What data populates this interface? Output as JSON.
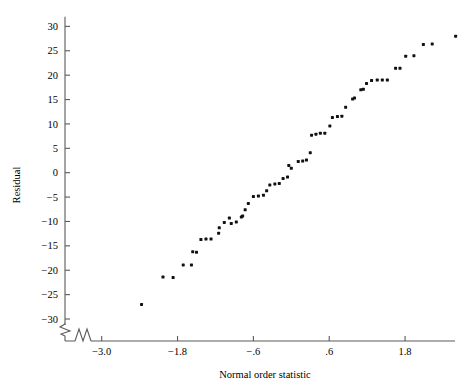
{
  "chart_data": {
    "type": "scatter",
    "title": "",
    "xlabel": "Normal order statistic",
    "ylabel": "Residual",
    "xlim": [
      -3.45,
      2.25
    ],
    "ylim": [
      -32.5,
      32.0
    ],
    "grid": false,
    "legend": null,
    "axis_break": {
      "x_axis": true,
      "y_axis": true
    },
    "xticks": [
      -3.0,
      -1.8,
      -0.6,
      0.6,
      1.8
    ],
    "xtick_labels": [
      "−3.0",
      "−1.8",
      "−.6",
      ".6",
      "1.8"
    ],
    "yticks": [
      30,
      25,
      20,
      15,
      10,
      5,
      0,
      -5,
      -10,
      -15,
      -20,
      -25,
      -30
    ],
    "ytick_labels": [
      "30",
      "25",
      "20",
      "15",
      "10",
      "5",
      "0",
      "−5",
      "−10",
      "−15",
      "−20",
      "−25",
      "−30"
    ],
    "marker": "filled-square",
    "marker_color": "#111111",
    "marker_size": 3.0,
    "n_points": 60,
    "points": [
      {
        "x": -2.37,
        "y": -27.0
      },
      {
        "x": -2.03,
        "y": -21.4
      },
      {
        "x": -1.87,
        "y": -21.5
      },
      {
        "x": -1.71,
        "y": -18.9
      },
      {
        "x": -1.58,
        "y": -18.9
      },
      {
        "x": -1.56,
        "y": -16.2
      },
      {
        "x": -1.5,
        "y": -16.3
      },
      {
        "x": -1.43,
        "y": -13.7
      },
      {
        "x": -1.35,
        "y": -13.6
      },
      {
        "x": -1.27,
        "y": -13.6
      },
      {
        "x": -1.15,
        "y": -12.4
      },
      {
        "x": -1.14,
        "y": -11.3
      },
      {
        "x": -1.06,
        "y": -10.2
      },
      {
        "x": -0.98,
        "y": -9.3
      },
      {
        "x": -0.95,
        "y": -10.4
      },
      {
        "x": -0.87,
        "y": -10.1
      },
      {
        "x": -0.79,
        "y": -9.1
      },
      {
        "x": -0.77,
        "y": -8.9
      },
      {
        "x": -0.73,
        "y": -7.6
      },
      {
        "x": -0.68,
        "y": -6.3
      },
      {
        "x": -0.6,
        "y": -4.9
      },
      {
        "x": -0.52,
        "y": -4.8
      },
      {
        "x": -0.44,
        "y": -4.6
      },
      {
        "x": -0.39,
        "y": -3.7
      },
      {
        "x": -0.34,
        "y": -2.5
      },
      {
        "x": -0.26,
        "y": -2.3
      },
      {
        "x": -0.19,
        "y": -2.2
      },
      {
        "x": -0.13,
        "y": -1.2
      },
      {
        "x": -0.06,
        "y": -0.9
      },
      {
        "x": -0.04,
        "y": 1.5
      },
      {
        "x": 0.0,
        "y": 0.9
      },
      {
        "x": 0.11,
        "y": 2.3
      },
      {
        "x": 0.18,
        "y": 2.4
      },
      {
        "x": 0.24,
        "y": 2.6
      },
      {
        "x": 0.3,
        "y": 4.1
      },
      {
        "x": 0.32,
        "y": 7.7
      },
      {
        "x": 0.39,
        "y": 7.9
      },
      {
        "x": 0.46,
        "y": 8.1
      },
      {
        "x": 0.53,
        "y": 8.1
      },
      {
        "x": 0.61,
        "y": 9.6
      },
      {
        "x": 0.65,
        "y": 11.3
      },
      {
        "x": 0.73,
        "y": 11.5
      },
      {
        "x": 0.8,
        "y": 11.6
      },
      {
        "x": 0.86,
        "y": 13.4
      },
      {
        "x": 0.97,
        "y": 15.1
      },
      {
        "x": 1.0,
        "y": 15.3
      },
      {
        "x": 1.1,
        "y": 17.0
      },
      {
        "x": 1.14,
        "y": 17.1
      },
      {
        "x": 1.19,
        "y": 18.3
      },
      {
        "x": 1.27,
        "y": 18.9
      },
      {
        "x": 1.36,
        "y": 19.0
      },
      {
        "x": 1.44,
        "y": 19.0
      },
      {
        "x": 1.52,
        "y": 19.0
      },
      {
        "x": 1.65,
        "y": 21.4
      },
      {
        "x": 1.72,
        "y": 21.4
      },
      {
        "x": 1.81,
        "y": 23.9
      },
      {
        "x": 1.94,
        "y": 24.0
      },
      {
        "x": 2.09,
        "y": 26.3
      },
      {
        "x": 2.23,
        "y": 26.4
      },
      {
        "x": 2.6,
        "y": 28.0
      }
    ]
  }
}
